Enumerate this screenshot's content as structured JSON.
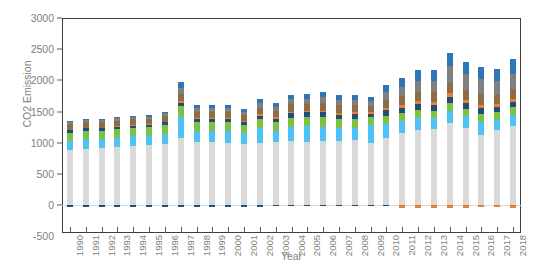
{
  "chart_data": {
    "type": "bar",
    "subtype": "stacked-column",
    "title": "",
    "xlabel": "Year",
    "ylabel": "CO2 Emission",
    "ylim": [
      -500,
      3000
    ],
    "ytick_labels": [
      "3000",
      "2500",
      "2000",
      "1500",
      "1000",
      "500",
      "0",
      "-500"
    ],
    "ytick_values": [
      3000,
      2500,
      2000,
      1500,
      1000,
      500,
      0,
      -500
    ],
    "grid": false,
    "legend": "none",
    "categories": [
      "1990",
      "1991",
      "1992",
      "1993",
      "1994",
      "1995",
      "1996",
      "1997",
      "1998",
      "1999",
      "2000",
      "2001",
      "2002",
      "2003",
      "2004",
      "2005",
      "2006",
      "2007",
      "2008",
      "2009",
      "2010",
      "2011",
      "2012",
      "2013",
      "2014",
      "2015",
      "2016",
      "2017",
      "2018"
    ],
    "series": [
      {
        "name": "series-1-light-gray",
        "color": "#d9d9d9",
        "values": [
          880,
          905,
          915,
          930,
          945,
          960,
          985,
          1080,
          1010,
          1015,
          1000,
          985,
          1000,
          1010,
          1020,
          1015,
          1035,
          1030,
          1040,
          1000,
          1075,
          1160,
          1200,
          1215,
          1320,
          1240,
          1120,
          1200,
          1260
        ]
      },
      {
        "name": "series-2-light-blue",
        "color": "#4fc3f7",
        "values": [
          150,
          150,
          145,
          150,
          155,
          150,
          160,
          340,
          185,
          180,
          185,
          175,
          230,
          180,
          230,
          260,
          215,
          200,
          195,
          285,
          225,
          190,
          195,
          175,
          195,
          185,
          210,
          170,
          185
        ]
      },
      {
        "name": "series-3-green",
        "color": "#7cc242",
        "values": [
          130,
          135,
          130,
          135,
          135,
          135,
          140,
          165,
          140,
          140,
          145,
          130,
          145,
          140,
          150,
          140,
          155,
          145,
          150,
          120,
          130,
          120,
          125,
          120,
          125,
          120,
          130,
          115,
          120
        ]
      },
      {
        "name": "series-4-navy",
        "color": "#1f4e79",
        "values": [
          40,
          40,
          40,
          40,
          40,
          40,
          45,
          55,
          50,
          50,
          50,
          45,
          60,
          55,
          75,
          70,
          80,
          75,
          70,
          60,
          90,
          95,
          100,
          95,
          95,
          90,
          95,
          85,
          90
        ]
      },
      {
        "name": "series-5-orange-pos",
        "color": "#ed7d31",
        "values": [
          10,
          10,
          10,
          10,
          10,
          10,
          10,
          35,
          15,
          15,
          15,
          15,
          20,
          20,
          25,
          25,
          30,
          30,
          30,
          25,
          40,
          45,
          50,
          50,
          55,
          50,
          55,
          45,
          50
        ]
      },
      {
        "name": "series-6-brown",
        "color": "#8c6d46",
        "values": [
          85,
          85,
          85,
          90,
          95,
          90,
          95,
          110,
          100,
          100,
          100,
          95,
          110,
          105,
          115,
          115,
          125,
          120,
          115,
          100,
          130,
          140,
          150,
          155,
          170,
          160,
          165,
          155,
          160
        ]
      },
      {
        "name": "series-7-gray",
        "color": "#808080",
        "values": [
          35,
          35,
          35,
          35,
          35,
          35,
          35,
          95,
          55,
          55,
          60,
          55,
          70,
          65,
          80,
          80,
          95,
          90,
          85,
          75,
          120,
          150,
          175,
          180,
          270,
          250,
          240,
          225,
          235
        ]
      },
      {
        "name": "series-8-steel-blue",
        "color": "#2e75b6",
        "values": [
          20,
          20,
          20,
          20,
          20,
          20,
          20,
          90,
          45,
          45,
          50,
          45,
          60,
          55,
          70,
          70,
          85,
          80,
          75,
          65,
          110,
          140,
          165,
          170,
          215,
          195,
          195,
          190,
          250
        ]
      }
    ],
    "negative_series": [
      {
        "name": "series-neg-navy",
        "color": "#1f4e79",
        "values": [
          -40,
          -40,
          -40,
          -40,
          -40,
          -40,
          -40,
          -35,
          -35,
          -35,
          -30,
          -25,
          -25,
          -20,
          -20,
          -15,
          -15,
          -15,
          -15,
          -10,
          -10,
          0,
          0,
          0,
          0,
          0,
          0,
          0,
          0
        ]
      },
      {
        "name": "series-neg-orange",
        "color": "#ed7d31",
        "values": [
          0,
          0,
          0,
          0,
          0,
          0,
          0,
          0,
          0,
          0,
          0,
          0,
          0,
          0,
          0,
          0,
          0,
          0,
          0,
          0,
          0,
          -45,
          -45,
          -45,
          -45,
          -45,
          -35,
          -40,
          -45
        ]
      }
    ],
    "totals": [
      1350,
      1380,
      1380,
      1410,
      1435,
      1440,
      1490,
      1970,
      1600,
      1600,
      1605,
      1545,
      1695,
      1630,
      1765,
      1775,
      1820,
      1770,
      1760,
      1730,
      1920,
      2040,
      2160,
      2160,
      2445,
      2290,
      2210,
      2185,
      2350
    ]
  },
  "axis": {
    "x_title": "Year",
    "y_title": "CO2 Emission"
  }
}
